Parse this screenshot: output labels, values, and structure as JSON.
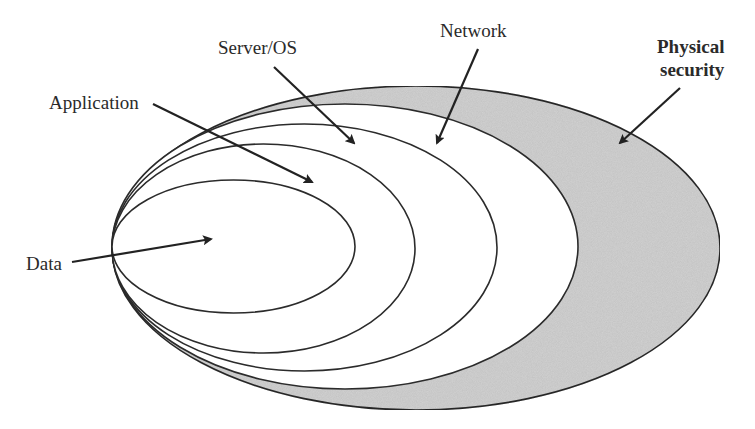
{
  "diagram": {
    "type": "nested-ellipses",
    "colors": {
      "background": "#ffffff",
      "outline": "#2b2b2b",
      "physical_fill": "#d3d3d3",
      "inner_fill": "#ffffff",
      "text": "#2a2a2a"
    },
    "layers": [
      {
        "id": "physical",
        "label_line1": "Physical",
        "label_line2": "security",
        "bold": true
      },
      {
        "id": "network",
        "label": "Network"
      },
      {
        "id": "server",
        "label": "Server/OS"
      },
      {
        "id": "application",
        "label": "Application"
      },
      {
        "id": "data",
        "label": "Data"
      }
    ]
  }
}
